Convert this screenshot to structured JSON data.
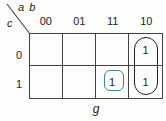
{
  "diagram": {
    "type": "karnaugh-map",
    "column_variables": "a b",
    "row_variable": "c",
    "function_label": "g",
    "column_headers": [
      "00",
      "01",
      "11",
      "10"
    ],
    "row_headers": [
      "0",
      "1"
    ],
    "cells": [
      [
        {
          "value": "",
          "col": "00",
          "row": "0"
        },
        {
          "value": "",
          "col": "01",
          "row": "0"
        },
        {
          "value": "",
          "col": "11",
          "row": "0"
        },
        {
          "value": "1",
          "col": "10",
          "row": "0"
        }
      ],
      [
        {
          "value": "",
          "col": "00",
          "row": "1"
        },
        {
          "value": "",
          "col": "01",
          "row": "1"
        },
        {
          "value": "1",
          "col": "11",
          "row": "1"
        },
        {
          "value": "1",
          "col": "10",
          "row": "1"
        }
      ]
    ],
    "groups": [
      {
        "name": "teal-single-cell-group",
        "color": "#3b8a86",
        "cells": [
          "11/1"
        ]
      },
      {
        "name": "black-column-group",
        "color": "#231f20",
        "cells": [
          "10/0",
          "10/1"
        ]
      }
    ],
    "colors": {
      "grid_line": "#44403d",
      "text": "#231f20",
      "teal_group": "#3b8a86",
      "black_group": "#231f20",
      "background": "#fdfdfc"
    }
  }
}
